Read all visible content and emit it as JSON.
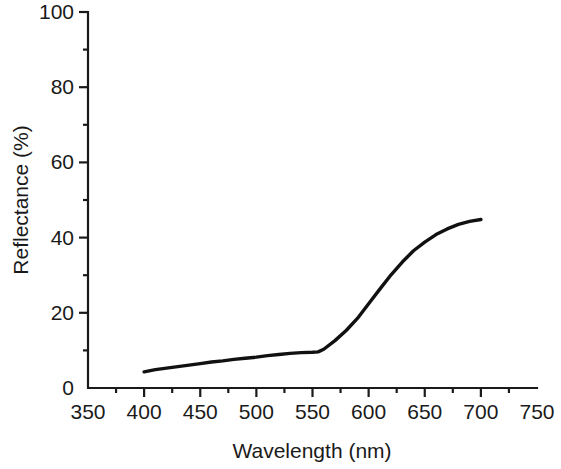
{
  "chart_data": {
    "type": "line",
    "title": "",
    "xlabel": "Wavelength (nm)",
    "ylabel": "Reflectance (%)",
    "xlim": [
      350,
      750
    ],
    "ylim": [
      0,
      100
    ],
    "grid": false,
    "legend": null,
    "x_ticks_major": [
      350,
      400,
      450,
      500,
      550,
      600,
      650,
      700,
      750
    ],
    "x_tick_labels": [
      "350",
      "400",
      "450",
      "500",
      "550",
      "600",
      "650",
      "700",
      "750"
    ],
    "x_ticks_minor": [
      375,
      425,
      475,
      525,
      575,
      625,
      675,
      725
    ],
    "y_ticks_major": [
      0,
      20,
      40,
      60,
      80,
      100
    ],
    "y_tick_labels": [
      "0",
      "20",
      "40",
      "60",
      "80",
      "100"
    ],
    "y_ticks_minor": [
      10,
      30,
      50,
      70,
      90
    ],
    "line_color": "#111111",
    "series": [
      {
        "name": "Reflectance spectrum",
        "x": [
          400,
          410,
          420,
          430,
          440,
          450,
          460,
          470,
          480,
          490,
          500,
          510,
          520,
          530,
          540,
          550,
          555,
          560,
          570,
          580,
          590,
          600,
          610,
          620,
          630,
          640,
          650,
          660,
          670,
          680,
          690,
          700
        ],
        "values": [
          4.3,
          4.9,
          5.3,
          5.7,
          6.1,
          6.5,
          6.9,
          7.2,
          7.6,
          7.9,
          8.2,
          8.6,
          8.9,
          9.2,
          9.4,
          9.5,
          9.6,
          10.3,
          12.6,
          15.3,
          18.5,
          22.4,
          26.3,
          30.1,
          33.5,
          36.5,
          38.8,
          40.8,
          42.3,
          43.5,
          44.3,
          44.8
        ]
      }
    ]
  },
  "figure": {
    "background_color": "#ffffff",
    "axis_color": "#1a1a1a"
  }
}
